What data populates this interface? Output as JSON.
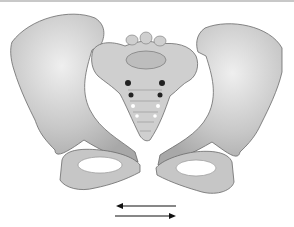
{
  "figure": {
    "arrows": {
      "top": "left",
      "bottom": "right"
    },
    "colors": {
      "bone": "#c9c9c9",
      "bone_light": "#e6e6e6",
      "outline": "#6a6a6a",
      "arrow": "#111111"
    }
  }
}
